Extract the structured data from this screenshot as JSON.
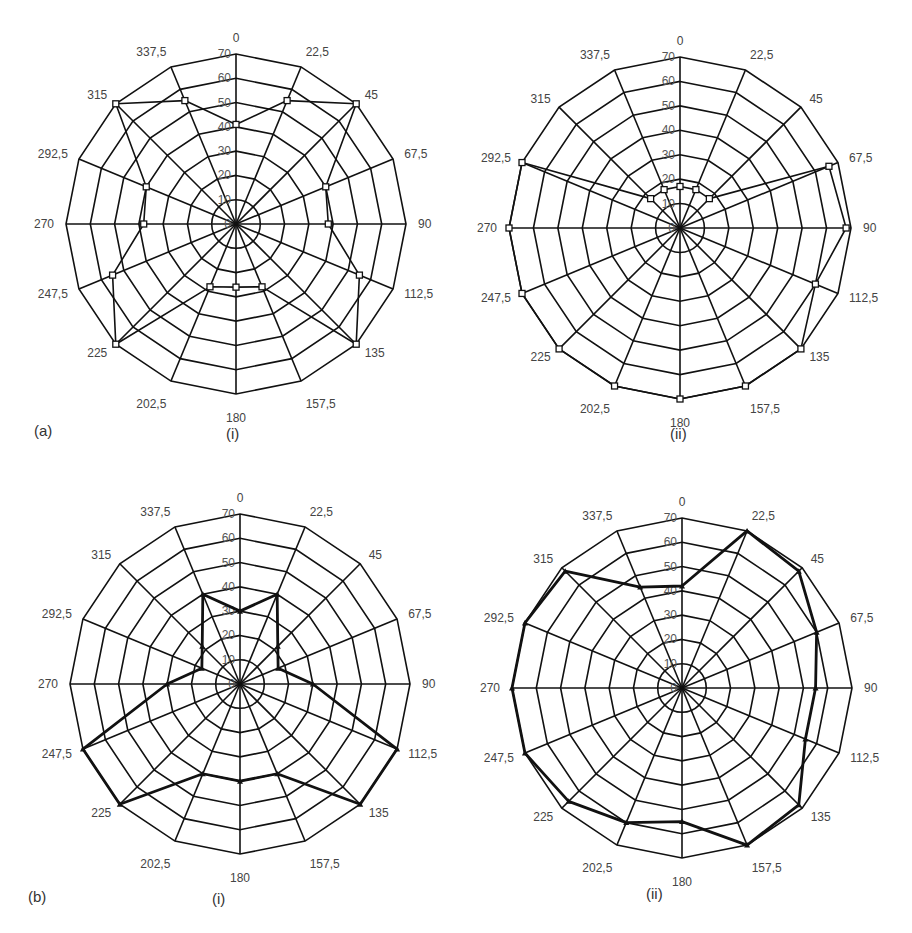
{
  "figure": {
    "row_labels": [
      "(a)",
      "(b)"
    ],
    "panel_labels": [
      "(i)",
      "(ii)",
      "(i)",
      "(ii)"
    ]
  },
  "chart_data": [
    {
      "type": "radar",
      "id": "a-i",
      "title": "(a) (i)",
      "categories": [
        "0",
        "22,5",
        "45",
        "67,5",
        "90",
        "112,5",
        "135",
        "157,5",
        "180",
        "202,5",
        "225",
        "247,5",
        "270",
        "292,5",
        "315",
        "337,5"
      ],
      "radial_ticks": [
        "0",
        "10",
        "20",
        "30",
        "40",
        "50",
        "60",
        "70"
      ],
      "rlim": [
        0,
        70
      ],
      "marker": "square",
      "line_weight": "thin",
      "series": [
        {
          "name": "series",
          "values": [
            41,
            55,
            70,
            40,
            38,
            55,
            70,
            28,
            26,
            28,
            70,
            55,
            38,
            40,
            70,
            55
          ]
        }
      ]
    },
    {
      "type": "radar",
      "id": "a-ii",
      "title": "(a) (ii)",
      "categories": [
        "0",
        "22,5",
        "45",
        "67,5",
        "90",
        "112,5",
        "135",
        "157,5",
        "180",
        "202,5",
        "225",
        "247,5",
        "270",
        "292,5",
        "315",
        "337,5"
      ],
      "radial_ticks": [
        "0",
        "10",
        "20",
        "30",
        "40",
        "50",
        "60",
        "70"
      ],
      "rlim": [
        0,
        70
      ],
      "marker": "square",
      "line_weight": "thin",
      "series": [
        {
          "name": "series",
          "values": [
            17,
            17,
            17,
            66,
            68,
            60,
            70,
            70,
            70,
            70,
            70,
            70,
            70,
            70,
            17,
            17
          ]
        }
      ]
    },
    {
      "type": "radar",
      "id": "b-i",
      "title": "(b) (i)",
      "categories": [
        "0",
        "22,5",
        "45",
        "67,5",
        "90",
        "112,5",
        "135",
        "157,5",
        "180",
        "202,5",
        "225",
        "247,5",
        "270",
        "292,5",
        "315",
        "337,5"
      ],
      "radial_ticks": [
        "0",
        "10",
        "20",
        "30",
        "40",
        "50",
        "60",
        "70"
      ],
      "rlim": [
        0,
        70
      ],
      "marker": "triangle",
      "line_weight": "thick",
      "series": [
        {
          "name": "series",
          "values": [
            30,
            40,
            22,
            17,
            30,
            70,
            70,
            40,
            40,
            40,
            70,
            70,
            30,
            17,
            22,
            40
          ]
        }
      ]
    },
    {
      "type": "radar",
      "id": "b-ii",
      "title": "(b) (ii)",
      "categories": [
        "0",
        "22,5",
        "45",
        "67,5",
        "90",
        "112,5",
        "135",
        "157,5",
        "180",
        "202,5",
        "225",
        "247,5",
        "270",
        "292,5",
        "315",
        "337,5"
      ],
      "radial_ticks": [
        "0",
        "10",
        "20",
        "30",
        "40",
        "50",
        "60",
        "70"
      ],
      "rlim": [
        0,
        70
      ],
      "marker": "triangle",
      "line_weight": "thick",
      "series": [
        {
          "name": "series",
          "values": [
            42,
            70,
            68,
            60,
            55,
            55,
            68,
            70,
            55,
            60,
            66,
            70,
            70,
            70,
            68,
            45
          ]
        }
      ]
    }
  ]
}
